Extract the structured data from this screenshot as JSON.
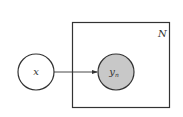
{
  "diagram": {
    "type": "plate-notation-graphical-model",
    "nodes": [
      {
        "id": "x",
        "label": "x",
        "observed": false,
        "fill": "#ffffff"
      },
      {
        "id": "y_n",
        "label": "y",
        "subscript": "n",
        "observed": true,
        "fill": "#c8c8c8"
      }
    ],
    "edges": [
      {
        "from": "x",
        "to": "y_n",
        "directed": true
      }
    ],
    "plates": [
      {
        "label": "N",
        "contains": [
          "y_n"
        ]
      }
    ],
    "colors": {
      "stroke": "#333333",
      "observed_fill": "#c8c8c8",
      "background": "#ffffff"
    }
  }
}
